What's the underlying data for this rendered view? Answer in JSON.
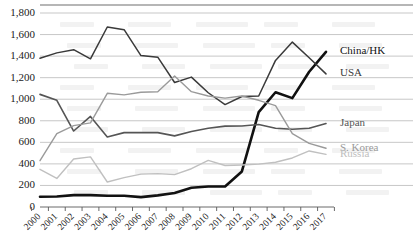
{
  "chart_data": {
    "type": "line",
    "title": "",
    "xlabel": "",
    "ylabel": "",
    "categories": [
      "2000",
      "2001",
      "2002",
      "2003",
      "2004",
      "2005",
      "2006",
      "2007",
      "2008",
      "2009",
      "2010",
      "2011",
      "2012",
      "2013",
      "2014",
      "2015",
      "2016",
      "2017"
    ],
    "ylim": [
      0,
      1800
    ],
    "ytick_labels": [
      "0",
      "200",
      "400",
      "600",
      "800",
      "1,000",
      "1,200",
      "1,400",
      "1,600",
      "1,800"
    ],
    "ytick_values": [
      0,
      200,
      400,
      600,
      800,
      1000,
      1200,
      1400,
      1600,
      1800
    ],
    "grid": true,
    "legend_position": "right-inline",
    "series": [
      {
        "name": "China/HK",
        "color": "#111111",
        "width": 2.6,
        "label": "China/HK",
        "label_value": 1440,
        "values": [
          95,
          98,
          110,
          110,
          105,
          105,
          92,
          108,
          130,
          178,
          190,
          190,
          330,
          880,
          1065,
          1010,
          1255,
          1440
        ]
      },
      {
        "name": "USA",
        "color": "#3a3a3a",
        "width": 1.5,
        "label": "USA",
        "label_value": 1235,
        "values": [
          1380,
          1430,
          1460,
          1375,
          1670,
          1645,
          1405,
          1390,
          1155,
          1205,
          1060,
          950,
          1025,
          1030,
          1360,
          1530,
          1385,
          1235
        ]
      },
      {
        "name": "Japan",
        "color": "#555555",
        "width": 1.6,
        "label": "Japan",
        "label_value": 775,
        "values": [
          1045,
          990,
          705,
          840,
          650,
          690,
          690,
          690,
          660,
          700,
          730,
          750,
          752,
          765,
          730,
          722,
          730,
          775
        ]
      },
      {
        "name": "S. Korea",
        "color": "#9a9a9a",
        "width": 1.4,
        "label": "S. Korea",
        "label_value": 545,
        "values": [
          430,
          680,
          755,
          780,
          1055,
          1040,
          1065,
          1070,
          1215,
          1070,
          1030,
          1010,
          1030,
          990,
          940,
          680,
          590,
          545
        ]
      },
      {
        "name": "Russia",
        "color": "#c0c0c0",
        "width": 1.4,
        "label": "Russia",
        "label_value": 488,
        "values": [
          350,
          265,
          445,
          465,
          232,
          272,
          305,
          310,
          300,
          355,
          432,
          385,
          390,
          398,
          415,
          455,
          520,
          488
        ]
      }
    ]
  }
}
